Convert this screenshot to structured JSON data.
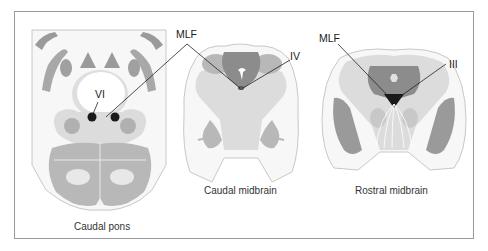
{
  "figure": {
    "panels": [
      {
        "id": "caudal-pons",
        "caption": "Caudal pons",
        "labels": [
          "VI"
        ]
      },
      {
        "id": "caudal-midbrain",
        "caption": "Caudal midbrain",
        "labels": [
          "IV"
        ]
      },
      {
        "id": "rostral-midbrain",
        "caption": "Rostral midbrain",
        "labels": [
          "MLF",
          "III"
        ]
      }
    ],
    "shared_labels": {
      "mlf_left": "MLF"
    },
    "labels": {
      "vi": "VI",
      "iv": "IV",
      "iii": "III",
      "mlf_1": "MLF",
      "mlf_2": "MLF"
    },
    "captions": {
      "caudal_pons": "Caudal pons",
      "caudal_midbrain": "Caudal midbrain",
      "rostral_midbrain": "Rostral midbrain"
    },
    "colors": {
      "dark_gray": "#8c8c8c",
      "mid_gray": "#b8b8b8",
      "light_gray": "#dcdcdc",
      "nucleus_black": "#1a1a1a",
      "outline": "#bdbdbd",
      "border": "#9a9a9a"
    }
  }
}
